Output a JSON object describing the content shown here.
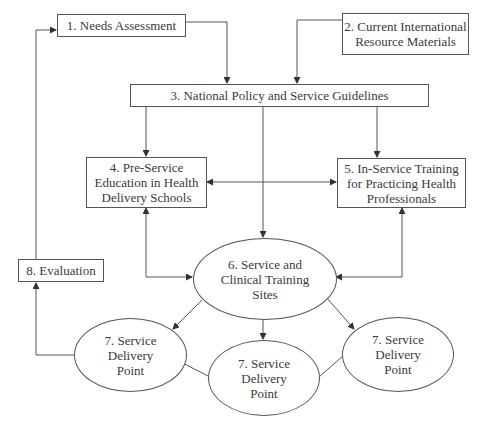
{
  "diagram": {
    "type": "flowchart",
    "nodes": {
      "n1": {
        "id": "1",
        "label": "1. Needs Assessment",
        "shape": "rectangle"
      },
      "n2": {
        "id": "2",
        "label": "2. Current International\nResource Materials",
        "shape": "rectangle"
      },
      "n3": {
        "id": "3",
        "label": "3. National Policy and Service Guidelines",
        "shape": "rectangle"
      },
      "n4": {
        "id": "4",
        "label": "4. Pre-Service\nEducation in Health\nDelivery Schools",
        "shape": "rectangle"
      },
      "n5": {
        "id": "5",
        "label": "5. In-Service Training\nfor Practicing Health\nProfessionals",
        "shape": "rectangle"
      },
      "n6": {
        "id": "6",
        "label": "6. Service and\nClinical Training\nSites",
        "shape": "ellipse"
      },
      "n7a": {
        "id": "7",
        "label": "7. Service\nDelivery\nPoint",
        "shape": "ellipse"
      },
      "n7b": {
        "id": "7",
        "label": "7. Service\nDelivery\nPoint",
        "shape": "ellipse"
      },
      "n7c": {
        "id": "7",
        "label": "7. Service\nDelivery\nPoint",
        "shape": "ellipse"
      },
      "n8": {
        "id": "8",
        "label": "8. Evaluation",
        "shape": "rectangle"
      }
    },
    "edges": [
      {
        "from": "1",
        "to": "3",
        "directed": true
      },
      {
        "from": "2",
        "to": "3",
        "directed": true
      },
      {
        "from": "3",
        "to": "4",
        "directed": true
      },
      {
        "from": "3",
        "to": "6",
        "directed": true
      },
      {
        "from": "3",
        "to": "5",
        "directed": true
      },
      {
        "from": "4",
        "to": "5",
        "directed": "both"
      },
      {
        "from": "4",
        "to": "6",
        "directed": "both"
      },
      {
        "from": "5",
        "to": "6",
        "directed": "both"
      },
      {
        "from": "6",
        "to": "7 (left)",
        "directed": true
      },
      {
        "from": "6",
        "to": "7 (middle)",
        "directed": true
      },
      {
        "from": "6",
        "to": "7 (right)",
        "directed": true
      },
      {
        "from": "7 (left)",
        "to": "7 (middle)",
        "directed": false
      },
      {
        "from": "7 (middle)",
        "to": "7 (right)",
        "directed": false
      },
      {
        "from": "7 (left)",
        "to": "8",
        "directed": true
      },
      {
        "from": "8",
        "to": "1",
        "directed": true
      }
    ],
    "colors": {
      "stroke": "#555555",
      "text": "#3a3a3a",
      "background": "#ffffff"
    }
  }
}
